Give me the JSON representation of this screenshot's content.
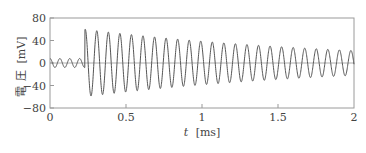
{
  "chart_data": {
    "type": "line",
    "title": "",
    "xlabel": "t [ms]",
    "xlabel_var": "t",
    "xlabel_unit": "[ms]",
    "ylabel": "電 圧 [mV]",
    "ylabel_chars": [
      "電",
      "圧"
    ],
    "ylabel_unit": "[mV]",
    "xlim": [
      0,
      2
    ],
    "ylim": [
      -80,
      80
    ],
    "x_ticks": [
      0,
      0.5,
      1,
      1.5,
      2
    ],
    "x_tick_labels": [
      "0",
      "0.5",
      "1",
      "1.5",
      "2"
    ],
    "y_ticks": [
      80,
      40,
      0,
      -40,
      -80
    ],
    "y_tick_labels": [
      "80",
      "40",
      "0",
      "−40",
      "−80"
    ],
    "grid": false,
    "zero_line": true,
    "legend": null,
    "series": [
      {
        "name": "voltage",
        "description": "Small pre-trigger ripple followed by an abrupt onset of a damped sinusoidal oscillation",
        "pre_onset": {
          "t_start": 0,
          "t_end": 0.23,
          "amplitude_mV": 8,
          "period_ms": 0.065
        },
        "onset_ms": 0.23,
        "post_onset": {
          "initial_amplitude_mV": 60,
          "final_amplitude_mV": 22,
          "period_ms": 0.076,
          "end_ms": 2.0
        },
        "approx_peaks": [
          {
            "t": 0.235,
            "v": 60
          },
          {
            "t": 0.31,
            "v": 56
          },
          {
            "t": 0.39,
            "v": 53
          },
          {
            "t": 0.46,
            "v": 50
          },
          {
            "t": 0.54,
            "v": 48
          },
          {
            "t": 0.62,
            "v": 46
          },
          {
            "t": 0.69,
            "v": 44
          },
          {
            "t": 0.77,
            "v": 42
          },
          {
            "t": 0.84,
            "v": 40
          },
          {
            "t": 0.92,
            "v": 38
          },
          {
            "t": 1.0,
            "v": 37
          },
          {
            "t": 1.5,
            "v": 28
          },
          {
            "t": 2.0,
            "v": 22
          }
        ],
        "approx_troughs": [
          {
            "t": 0.27,
            "v": -56
          },
          {
            "t": 0.35,
            "v": -53
          },
          {
            "t": 0.43,
            "v": -50
          },
          {
            "t": 0.5,
            "v": -48
          },
          {
            "t": 1.0,
            "v": -36
          },
          {
            "t": 1.5,
            "v": -28
          },
          {
            "t": 1.95,
            "v": -22
          }
        ]
      }
    ],
    "colors": {
      "line": "#555555",
      "frame": "#999999",
      "zero_line": "#999999"
    }
  }
}
